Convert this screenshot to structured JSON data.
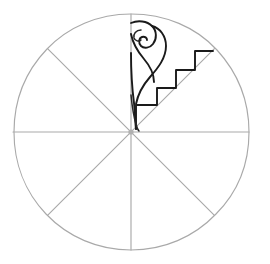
{
  "figure": {
    "title": "Eight-sector circle with decorated sector",
    "background_color": "#ffffff",
    "guide_color": "#a9a9a9",
    "motif_color": "#1a1a1a",
    "canvas": {
      "width": 270,
      "height": 264
    }
  },
  "circle": {
    "label": "outer-circle",
    "center_x": 131,
    "center_y": 132,
    "radius": 118,
    "stroke_color": "#a9a9a9",
    "stroke_width": 1.15
  },
  "sectors": {
    "count": 8,
    "angle_degrees": 45,
    "divider_count": 4,
    "dividers": [
      {
        "name": "vertical-divider",
        "angle": 90
      },
      {
        "name": "horizontal-divider",
        "angle": 0
      },
      {
        "name": "diagonal-divider-ne-sw",
        "angle": 45
      },
      {
        "name": "diagonal-divider-nw-se",
        "angle": 135
      }
    ],
    "decorated_sector": {
      "name": "upper-right-inner-sector",
      "start_angle": 45,
      "end_angle": 90,
      "fill": "none"
    }
  },
  "motif": {
    "name": "spiral-and-staircase-motif",
    "elements": [
      {
        "name": "spiral-volute",
        "type": "curved-scroll"
      },
      {
        "name": "staircase-zigzag",
        "type": "stepped-band",
        "steps": 4
      },
      {
        "name": "spiral-tail",
        "type": "tapering-stroke"
      }
    ],
    "stroke_color": "#1a1a1a"
  }
}
